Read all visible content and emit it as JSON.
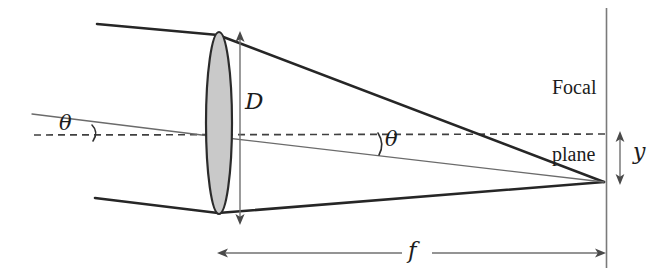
{
  "figure": {
    "type": "optics-ray-diagram",
    "background_color": "#ffffff",
    "ink_color": "#1c1c1c",
    "thin_line_color": "#6b6b6b",
    "lens_fill_color": "#c8c8c8",
    "lens_stroke_color": "#2b2b2b"
  },
  "labels": {
    "aperture_diameter": "D",
    "focal_length": "f",
    "image_height": "y",
    "angle_incoming": "θ",
    "angle_focal": "θ",
    "focal_plane_line_1": "Focal",
    "focal_plane_line_2": "plane"
  },
  "elements": {
    "lens": {
      "name": "biconvex-lens",
      "center_x": 219,
      "center_y": 123,
      "semi_axis_x": 13,
      "semi_axis_y": 91,
      "top_y": 32,
      "bottom_y": 214
    },
    "optical_axis": {
      "name": "optical-axis-dashed",
      "x1": 34,
      "x2": 607,
      "y": 135,
      "style": "dashed"
    },
    "focal_plane": {
      "name": "focal-plane-line",
      "x": 606,
      "y1": 8,
      "y2": 268,
      "style": "solid-thin"
    },
    "focal_point": {
      "x": 604,
      "y": 182
    },
    "rays": [
      {
        "name": "upper-marginal-ray",
        "points": [
          [
            97,
            24
          ],
          [
            218,
            35
          ],
          [
            604,
            182
          ]
        ],
        "weight": "thick"
      },
      {
        "name": "chief-ray-through-center",
        "points": [
          [
            32,
            114
          ],
          [
            218,
            137
          ],
          [
            604,
            182
          ]
        ],
        "weight": "thin"
      },
      {
        "name": "lower-marginal-ray",
        "points": [
          [
            95,
            198
          ],
          [
            218,
            213
          ],
          [
            604,
            182
          ]
        ],
        "weight": "thick"
      }
    ],
    "dimension_arrows": [
      {
        "name": "aperture-diameter-arrow",
        "orientation": "vertical",
        "x": 240,
        "y1": 34,
        "y2": 222,
        "label": "D"
      },
      {
        "name": "image-height-arrow",
        "orientation": "vertical",
        "x": 620,
        "y1": 134,
        "y2": 182,
        "label": "y"
      },
      {
        "name": "focal-length-arrow",
        "orientation": "horizontal",
        "y": 253,
        "x1": 218,
        "x2": 605,
        "label": "f"
      }
    ],
    "angle_arcs": [
      {
        "name": "angle-arc-incoming",
        "vertex_x": 34,
        "vertex_y": 135,
        "radius": 58
      },
      {
        "name": "angle-arc-focal",
        "vertex_x": 604,
        "vertex_y": 182,
        "radius": 226
      }
    ]
  }
}
